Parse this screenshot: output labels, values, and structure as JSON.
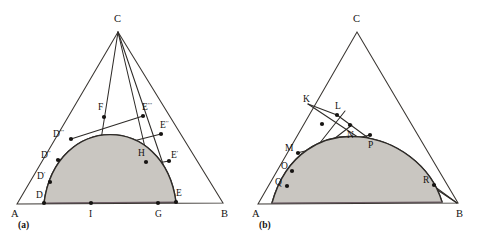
{
  "figure": {
    "background_color": "#ffffff",
    "shade_color": "#c9c6c1",
    "line_color": "#2e2b28",
    "base_color": "#6b5a63",
    "panels": [
      {
        "id": "panel-a",
        "caption": "(a)",
        "caption_pos": {
          "x": 18,
          "y": 228
        },
        "triangle": {
          "A": {
            "x": 17,
            "y": 204
          },
          "B": {
            "x": 223,
            "y": 203
          },
          "C": {
            "x": 118,
            "y": 32
          }
        },
        "corner_labels": [
          {
            "name": "A",
            "text": "A",
            "x": 11,
            "y": 217
          },
          {
            "name": "B",
            "text": "B",
            "x": 221,
            "y": 217
          },
          {
            "name": "C",
            "text": "C",
            "x": 114,
            "y": 22
          }
        ],
        "arc": {
          "start": {
            "x": 44,
            "y": 203
          },
          "end": {
            "x": 176,
            "y": 202
          },
          "ctrl1": {
            "x": 56,
            "y": 112
          },
          "ctrl2": {
            "x": 164,
            "y": 112
          }
        },
        "base_segment": {
          "x1": 44,
          "y1": 203,
          "x2": 176,
          "y2": 202
        },
        "rays_from_C": [
          {
            "name": "ray-C-I",
            "x1": 118,
            "y1": 32,
            "x2": 91,
            "y2": 203
          },
          {
            "name": "ray-C-G",
            "x1": 118,
            "y1": 32,
            "x2": 158,
            "y2": 203
          },
          {
            "name": "ray-C-E",
            "x1": 118,
            "y1": 32,
            "x2": 176,
            "y2": 202
          }
        ],
        "chords": [
          {
            "name": "chord-D-E",
            "x1": 44,
            "y1": 203,
            "x2": 176,
            "y2": 202
          },
          {
            "name": "chord-Dp-Ep",
            "x1": 50,
            "y1": 182,
            "x2": 169,
            "y2": 161
          },
          {
            "name": "chord-Dpp-Epp",
            "x1": 58,
            "y1": 160,
            "x2": 161,
            "y2": 134
          },
          {
            "name": "chord-Dppp-Eppp",
            "x1": 71,
            "y1": 139,
            "x2": 143,
            "y2": 116
          }
        ],
        "points": [
          {
            "name": "point-D",
            "label": "D",
            "x": 44,
            "y": 203,
            "lx": 36,
            "ly": 198,
            "primes": 0
          },
          {
            "name": "point-Dp",
            "label": "D",
            "x": 50,
            "y": 182,
            "lx": 37,
            "ly": 179,
            "primes": 1
          },
          {
            "name": "point-Dpp",
            "label": "D",
            "x": 58,
            "y": 160,
            "lx": 41,
            "ly": 158,
            "primes": 2
          },
          {
            "name": "point-Dppp",
            "label": "D",
            "x": 71,
            "y": 139,
            "lx": 53,
            "ly": 137,
            "primes": 3
          },
          {
            "name": "point-F",
            "label": "F",
            "x": 104,
            "y": 117,
            "lx": 98,
            "ly": 110,
            "primes": 0
          },
          {
            "name": "point-Eppp",
            "label": "E",
            "x": 143,
            "y": 116,
            "lx": 142,
            "ly": 110,
            "primes": 3
          },
          {
            "name": "point-Epp",
            "label": "E",
            "x": 161,
            "y": 134,
            "lx": 160,
            "ly": 128,
            "primes": 2
          },
          {
            "name": "point-Ep",
            "label": "E",
            "x": 169,
            "y": 161,
            "lx": 171,
            "ly": 158,
            "primes": 1
          },
          {
            "name": "point-H",
            "label": "H",
            "x": 146,
            "y": 162,
            "lx": 138,
            "ly": 156,
            "primes": 0
          },
          {
            "name": "point-E",
            "label": "E",
            "x": 176,
            "y": 202,
            "lx": 176,
            "ly": 196,
            "primes": 0
          },
          {
            "name": "point-I",
            "label": "I",
            "x": 91,
            "y": 203,
            "lx": 89,
            "ly": 217,
            "primes": 0
          },
          {
            "name": "point-G",
            "label": "G",
            "x": 158,
            "y": 203,
            "lx": 155,
            "ly": 217,
            "primes": 0
          }
        ]
      },
      {
        "id": "panel-b",
        "caption": "(b)",
        "caption_pos": {
          "x": 259,
          "y": 228
        },
        "triangle": {
          "A": {
            "x": 258,
            "y": 204
          },
          "B": {
            "x": 458,
            "y": 203
          },
          "C": {
            "x": 357,
            "y": 32
          }
        },
        "corner_labels": [
          {
            "name": "A",
            "text": "A",
            "x": 252,
            "y": 217
          },
          {
            "name": "B",
            "text": "B",
            "x": 456,
            "y": 217
          },
          {
            "name": "C",
            "text": "C",
            "x": 353,
            "y": 22
          }
        ],
        "arc": {
          "start": {
            "x": 272,
            "y": 203
          },
          "end": {
            "x": 442,
            "y": 202
          },
          "ctrl1": {
            "x": 300,
            "y": 102
          },
          "ctrl2": {
            "x": 420,
            "y": 128
          }
        },
        "base_segment": {
          "x1": 272,
          "y1": 203,
          "x2": 442,
          "y2": 202
        },
        "chords": [
          {
            "name": "chord-K-R",
            "x1": 308,
            "y1": 104,
            "x2": 457,
            "y2": 203
          },
          {
            "name": "chord-L-B",
            "x1": 337,
            "y1": 115,
            "x2": 457,
            "y2": 203
          },
          {
            "name": "chord-Q-L",
            "x1": 286,
            "y1": 186,
            "x2": 345,
            "y2": 111
          },
          {
            "name": "chord-O-N",
            "x1": 291,
            "y1": 172,
            "x2": 352,
            "y2": 125
          },
          {
            "name": "chord-M-P",
            "x1": 297,
            "y1": 153,
            "x2": 370,
            "y2": 135
          },
          {
            "name": "chord-Q-R",
            "x1": 286,
            "y1": 186,
            "x2": 434,
            "y2": 185
          },
          {
            "name": "chord-K-L",
            "x1": 308,
            "y1": 104,
            "x2": 337,
            "y2": 115
          }
        ],
        "points": [
          {
            "name": "point-K",
            "label": "K",
            "x": 316,
            "y": 108,
            "lx": 303,
            "ly": 102,
            "primes": 0,
            "dot": false
          },
          {
            "name": "point-L",
            "label": "L",
            "x": 337,
            "y": 115,
            "lx": 335,
            "ly": 109,
            "primes": 0,
            "dot": true
          },
          {
            "name": "point-L2",
            "label": "",
            "x": 322,
            "y": 124,
            "lx": 0,
            "ly": 0,
            "primes": 0,
            "dot": true
          },
          {
            "name": "point-N",
            "label": "N",
            "x": 350,
            "y": 125,
            "lx": 347,
            "ly": 138,
            "primes": 0,
            "dot": true
          },
          {
            "name": "point-P",
            "label": "P",
            "x": 370,
            "y": 135,
            "lx": 368,
            "ly": 148,
            "primes": 0,
            "dot": true
          },
          {
            "name": "point-M",
            "label": "M",
            "x": 298,
            "y": 153,
            "lx": 285,
            "ly": 151,
            "primes": 0,
            "dot": true
          },
          {
            "name": "point-O",
            "label": "O",
            "x": 292,
            "y": 171,
            "lx": 281,
            "ly": 169,
            "primes": 0,
            "dot": true
          },
          {
            "name": "point-Q",
            "label": "Q",
            "x": 287,
            "y": 186,
            "lx": 275,
            "ly": 185,
            "primes": 0,
            "dot": true
          },
          {
            "name": "point-R",
            "label": "R",
            "x": 434,
            "y": 185,
            "lx": 423,
            "ly": 183,
            "primes": 0,
            "dot": true
          }
        ]
      }
    ]
  }
}
